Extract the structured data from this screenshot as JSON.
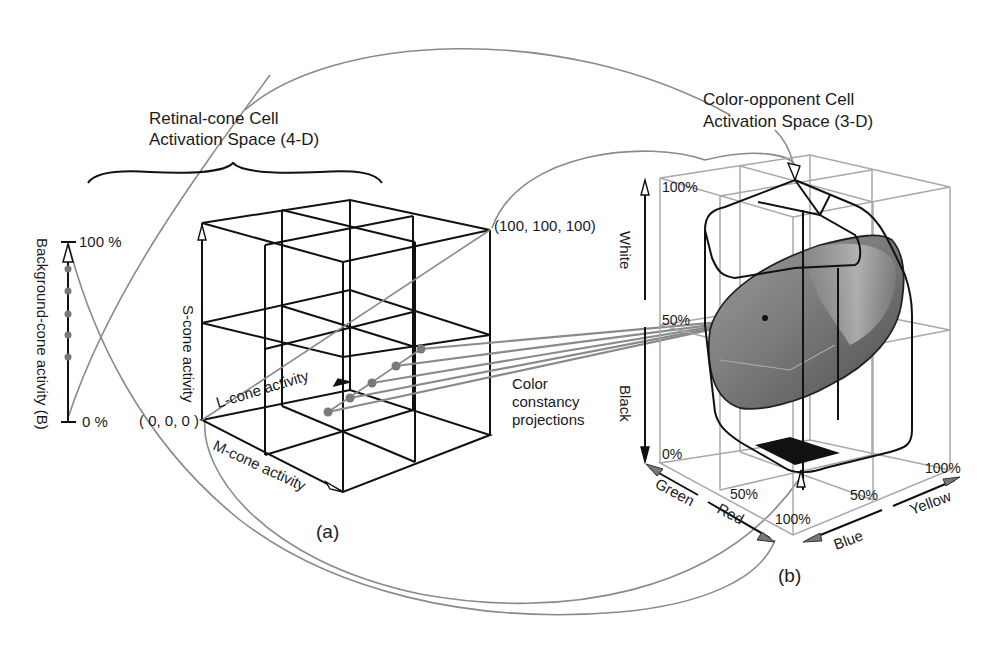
{
  "figure": {
    "panel_a": {
      "caption": "(a)",
      "title_line1": "Retinal-cone Cell",
      "title_line2": "Activation Space  (4-D)",
      "background_axis": {
        "label": "Background-cone activity (B)",
        "top_tick": "100 %",
        "bottom_tick": "0 %",
        "dot_count": 5
      },
      "cube": {
        "origin_label": "( 0, 0, 0 )",
        "corner_label": "(100, 100, 100)",
        "s_axis_label": "S-cone activity",
        "l_axis_label": "L-cone activity",
        "m_axis_label": "M-cone activity",
        "sample_point_count": 5
      }
    },
    "projection_note_line1": "Color",
    "projection_note_line2": "constancy",
    "projection_note_line3": "projections",
    "panel_b": {
      "caption": "(b)",
      "title_line1": "Color-opponent Cell",
      "title_line2": "Activation Space (3-D)",
      "vertical_axis": {
        "top_label": "White",
        "bottom_label": "Black",
        "tick_100": "100%",
        "tick_50": "50%",
        "tick_0": "0%"
      },
      "red_green_axis": {
        "label_green": "Green",
        "label_red": "Red",
        "tick_50": "50%",
        "tick_100": "100%"
      },
      "blue_yellow_axis": {
        "label_blue": "Blue",
        "label_yellow": "Yellow",
        "tick_50": "50%",
        "tick_100": "100%"
      }
    },
    "colors": {
      "line_black": "#111111",
      "connector_gray": "#8a8a8a",
      "grid_gray": "#a8a8a8",
      "solid_dark": "#4a4a4a",
      "solid_mid": "#7a7a7a",
      "solid_light": "#b5b5b5"
    }
  }
}
